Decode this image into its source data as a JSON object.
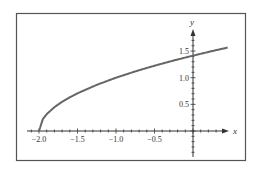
{
  "chart_data": {
    "type": "line",
    "title": "",
    "xlabel": "x",
    "ylabel": "y",
    "xlim": [
      -2.2,
      0.5
    ],
    "ylim": [
      -0.5,
      1.8
    ],
    "grid": false,
    "legend": null,
    "x_ticks": [
      -2.0,
      -1.5,
      -1.0,
      -0.5
    ],
    "x_tick_labels": [
      "−2.0",
      "−1.5",
      "−1.0",
      "−0.5"
    ],
    "y_ticks": [
      0.5,
      1.0,
      1.5
    ],
    "y_tick_labels": [
      "0.5",
      "1.0",
      "1.5"
    ],
    "series": [
      {
        "name": "y = sqrt(x + 2)",
        "color": "#666666",
        "x": [
          -2.0,
          -1.95,
          -1.9,
          -1.8,
          -1.7,
          -1.6,
          -1.5,
          -1.25,
          -1.0,
          -0.75,
          -0.5,
          -0.25,
          0.0,
          0.25,
          0.45
        ],
        "y": [
          0.0,
          0.224,
          0.316,
          0.447,
          0.548,
          0.632,
          0.707,
          0.866,
          1.0,
          1.118,
          1.225,
          1.323,
          1.414,
          1.5,
          1.565
        ]
      }
    ]
  },
  "colors": {
    "frame": "#555555",
    "axis": "#333333",
    "curve": "#666666"
  }
}
